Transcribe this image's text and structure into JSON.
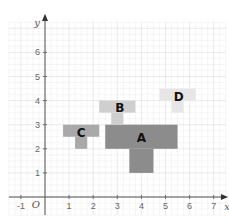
{
  "diagram": {
    "type": "coordinate-grid",
    "x_axis": {
      "label": "x",
      "ticks": [
        "-1",
        "1",
        "2",
        "3",
        "4",
        "5",
        "6",
        "7"
      ],
      "min": -1,
      "max": 7
    },
    "y_axis": {
      "label": "y",
      "ticks": [
        "1",
        "2",
        "3",
        "4",
        "5",
        "6"
      ],
      "min": 0,
      "max": 7
    },
    "origin_label": "O",
    "shapes": [
      {
        "label": "A",
        "color": "#8c8c8c",
        "rects": [
          {
            "x1": 2.5,
            "y1": 2,
            "x2": 5.5,
            "y2": 3
          },
          {
            "x1": 3.5,
            "y1": 1,
            "x2": 4.5,
            "y2": 2
          }
        ],
        "label_pos": {
          "x": 4,
          "y": 2.5
        }
      },
      {
        "label": "B",
        "color": "#cfcfcf",
        "rects": [
          {
            "x1": 2.25,
            "y1": 3.5,
            "x2": 3.75,
            "y2": 4
          },
          {
            "x1": 2.75,
            "y1": 3,
            "x2": 3.25,
            "y2": 3.5
          }
        ],
        "label_pos": {
          "x": 3.1,
          "y": 3.75
        }
      },
      {
        "label": "C",
        "color": "#a9a9a9",
        "rects": [
          {
            "x1": 0.75,
            "y1": 2.5,
            "x2": 2.25,
            "y2": 3
          },
          {
            "x1": 1.25,
            "y1": 2,
            "x2": 1.75,
            "y2": 2.5
          }
        ],
        "label_pos": {
          "x": 1.5,
          "y": 2.7
        }
      },
      {
        "label": "D",
        "color": "#e6e6e6",
        "rects": [
          {
            "x1": 4.75,
            "y1": 4,
            "x2": 6.25,
            "y2": 4.5
          },
          {
            "x1": 5.25,
            "y1": 3.5,
            "x2": 5.75,
            "y2": 4
          }
        ],
        "label_pos": {
          "x": 5.55,
          "y": 4.2
        }
      }
    ]
  }
}
